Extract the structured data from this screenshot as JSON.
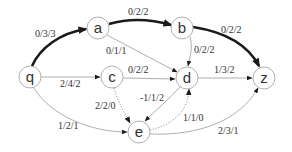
{
  "diagram": {
    "type": "flow-network",
    "nodes": [
      {
        "id": "q",
        "label": "q"
      },
      {
        "id": "a",
        "label": "a"
      },
      {
        "id": "b",
        "label": "b"
      },
      {
        "id": "c",
        "label": "c"
      },
      {
        "id": "d",
        "label": "d"
      },
      {
        "id": "z",
        "label": "z"
      },
      {
        "id": "e",
        "label": "e"
      }
    ],
    "edges": [
      {
        "from": "q",
        "to": "a",
        "label": "0/3/3",
        "style": "thick"
      },
      {
        "from": "a",
        "to": "b",
        "label": "0/2/2",
        "style": "thick"
      },
      {
        "from": "b",
        "to": "z",
        "label": "0/2/2",
        "style": "thick"
      },
      {
        "from": "a",
        "to": "d",
        "label": "0/1/1",
        "style": "thin"
      },
      {
        "from": "b",
        "to": "d",
        "label": "0/2/2",
        "style": "thin"
      },
      {
        "from": "q",
        "to": "c",
        "label": "2/4/2",
        "style": "thin"
      },
      {
        "from": "c",
        "to": "d",
        "label": "0/2/2",
        "style": "thin"
      },
      {
        "from": "d",
        "to": "z",
        "label": "1/3/2",
        "style": "thin"
      },
      {
        "from": "c",
        "to": "e",
        "label": "2/2/0",
        "style": "dotted"
      },
      {
        "from": "d",
        "to": "e",
        "label": "-1/1/2",
        "style": "thin"
      },
      {
        "from": "e",
        "to": "d",
        "label": "1/1/0",
        "style": "dotted"
      },
      {
        "from": "q",
        "to": "e",
        "label": "1/2/1",
        "style": "thin"
      },
      {
        "from": "e",
        "to": "z",
        "label": "2/3/1",
        "style": "thin"
      }
    ]
  }
}
